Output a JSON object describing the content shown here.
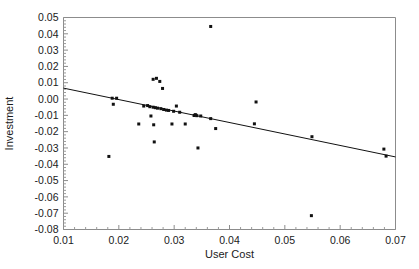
{
  "chart_data": {
    "type": "scatter",
    "title": "",
    "xlabel": "User Cost",
    "ylabel": "Investment",
    "xlim": [
      0.01,
      0.07
    ],
    "ylim": [
      -0.08,
      0.05
    ],
    "grid": false,
    "legend": "none",
    "xticks": [
      0.01,
      0.02,
      0.03,
      0.04,
      0.05,
      0.06,
      0.07
    ],
    "xtick_labels": [
      "0.01",
      "0.02",
      "0.03",
      "0.04",
      "0.05",
      "0.06",
      "0.07"
    ],
    "yticks": [
      0.05,
      0.04,
      0.03,
      0.02,
      0.01,
      0.0,
      -0.01,
      -0.02,
      -0.03,
      -0.04,
      -0.05,
      -0.06,
      -0.07,
      -0.08
    ],
    "ytick_labels": [
      "0.05",
      "0.04",
      "0.03",
      "0.02",
      "0.01",
      "0.00",
      "-0.01",
      "-0.02",
      "-0.03",
      "-0.04",
      "-0.05",
      "-0.06",
      "-0.07",
      "-0.08"
    ],
    "x_minor_tick_count": 5,
    "y_minor_tick_count": 5,
    "marker": "filled-square",
    "marker_size_px": 3,
    "point_color": "#111111",
    "line_color": "#111111",
    "frame_color": "#8c8c8c",
    "points": [
      {
        "x": 0.0182,
        "y": -0.0352
      },
      {
        "x": 0.0188,
        "y": 0.0005
      },
      {
        "x": 0.019,
        "y": -0.0032
      },
      {
        "x": 0.0196,
        "y": 0.0005
      },
      {
        "x": 0.0236,
        "y": -0.0153
      },
      {
        "x": 0.0245,
        "y": -0.0043
      },
      {
        "x": 0.0252,
        "y": -0.004
      },
      {
        "x": 0.0256,
        "y": -0.0047
      },
      {
        "x": 0.0258,
        "y": -0.0104
      },
      {
        "x": 0.0262,
        "y": 0.0121
      },
      {
        "x": 0.0262,
        "y": -0.005
      },
      {
        "x": 0.0263,
        "y": -0.0158
      },
      {
        "x": 0.0264,
        "y": -0.0263
      },
      {
        "x": 0.0266,
        "y": -0.0053
      },
      {
        "x": 0.0268,
        "y": 0.0127
      },
      {
        "x": 0.027,
        "y": -0.0056
      },
      {
        "x": 0.0274,
        "y": 0.0108
      },
      {
        "x": 0.0276,
        "y": -0.0059
      },
      {
        "x": 0.0279,
        "y": 0.0065
      },
      {
        "x": 0.0281,
        "y": -0.0064
      },
      {
        "x": 0.0286,
        "y": -0.0068
      },
      {
        "x": 0.029,
        "y": -0.007
      },
      {
        "x": 0.0296,
        "y": -0.0153
      },
      {
        "x": 0.0299,
        "y": -0.0075
      },
      {
        "x": 0.0304,
        "y": -0.0043
      },
      {
        "x": 0.031,
        "y": -0.0081
      },
      {
        "x": 0.032,
        "y": -0.0153
      },
      {
        "x": 0.0336,
        "y": -0.0101
      },
      {
        "x": 0.0338,
        "y": -0.0096
      },
      {
        "x": 0.0339,
        "y": -0.0098
      },
      {
        "x": 0.0341,
        "y": -0.0102
      },
      {
        "x": 0.0343,
        "y": -0.03
      },
      {
        "x": 0.0348,
        "y": -0.0104
      },
      {
        "x": 0.0366,
        "y": 0.0445
      },
      {
        "x": 0.0366,
        "y": -0.012
      },
      {
        "x": 0.0375,
        "y": -0.0181
      },
      {
        "x": 0.0445,
        "y": -0.0152
      },
      {
        "x": 0.0448,
        "y": -0.0018
      },
      {
        "x": 0.0548,
        "y": -0.0715
      },
      {
        "x": 0.0549,
        "y": -0.0231
      },
      {
        "x": 0.0679,
        "y": -0.0307
      },
      {
        "x": 0.0683,
        "y": -0.035
      }
    ],
    "trend_line": {
      "x_start": 0.01,
      "y_start": 0.0067,
      "x_end": 0.07,
      "y_end": -0.0355
    }
  }
}
